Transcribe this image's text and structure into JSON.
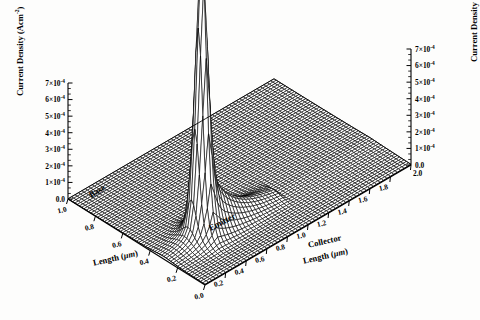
{
  "figure": {
    "kind": "3d-surface-wireframe",
    "background": "#fdfdfc",
    "ink": "#000000"
  },
  "chart_data": {
    "type": "line",
    "render": "3d-wireframe-surface",
    "title": "",
    "subtitle": "",
    "zlabel": "Current Density (Acm",
    "zlabel_sup": "-2",
    "zlabel_tail": ")",
    "xlabel": "Length (",
    "xlabel_unit": "μm",
    "xlabel_tail": ")",
    "ylabel": "Length (",
    "ylabel_unit": "μm",
    "ylabel_tail": ")",
    "ylabel_prefix": "Collector",
    "grid": false,
    "legend": "none",
    "annotations": [
      {
        "text": "Emitter",
        "x_um": 0.3,
        "y_um": 0.42,
        "rotation": -28
      },
      {
        "text": "Base",
        "x_um": 0.92,
        "y_um": 0.08,
        "rotation": -30
      }
    ],
    "z_axis": {
      "label": "Current Density (Acm-2)",
      "min": 0.0,
      "max": 0.0007,
      "tick_values": [
        0.0,
        0.0001,
        0.0002,
        0.0003,
        0.0004,
        0.0005,
        0.0006,
        0.0007
      ],
      "tick_labels": [
        "0.0",
        "1×10",
        "2×10",
        "3×10",
        "4×10",
        "5×10",
        "6×10",
        "7×10"
      ],
      "tick_exponent": "-4",
      "minor_ticks_per_major": 2,
      "duplicated_on_right": true
    },
    "x_axis": {
      "label": "Length (μm)",
      "side": "left-front",
      "min": 0.0,
      "max": 1.0,
      "direction": "descending-left-to-right",
      "tick_values": [
        1.0,
        0.8,
        0.6,
        0.4,
        0.2,
        0.0
      ],
      "tick_labels": [
        "1.0",
        "0.8",
        "0.6",
        "0.4",
        "0.2",
        "0.0"
      ]
    },
    "y_axis": {
      "label": "Collector Length (μm)",
      "side": "right-front",
      "min": 0.0,
      "max": 2.0,
      "direction": "ascending-left-to-right",
      "tick_values": [
        0.0,
        0.2,
        0.4,
        0.6,
        0.8,
        1.0,
        1.2,
        1.4,
        1.6,
        1.8,
        2.0
      ],
      "tick_labels": [
        "0.0",
        "0.2",
        "0.4",
        "0.6",
        "0.8",
        "1.0",
        "1.2",
        "1.4",
        "1.6",
        "1.8",
        "2.0"
      ]
    },
    "surface_model": {
      "description": "Current density over emitter-base-collector area: narrow singular spike at the emitter edge, a ridge decaying along the emitter stripe, flat near-zero plateau over the collector region.",
      "nx": 60,
      "ny": 60,
      "peak": {
        "x_um": 0.3,
        "y_um": 0.36,
        "z": 0.00125
      },
      "ridge": {
        "along": "x",
        "x_um": 0.3,
        "y_from_um": 0.36,
        "y_to_um": 0.95,
        "z_start": 0.00052,
        "z_end": 6e-05
      },
      "spike_sigma_x_um": 0.03,
      "spike_sigma_y_um": 0.045,
      "ridge_sigma_um": 0.055,
      "shelf_z": 1e-05,
      "baseline_z": 0.0
    },
    "projection": {
      "origin_front_px": [
        205,
        285
      ],
      "corner_left_px": [
        68,
        199
      ],
      "corner_right_px": [
        411,
        165
      ],
      "z_height_px": 116
    }
  }
}
